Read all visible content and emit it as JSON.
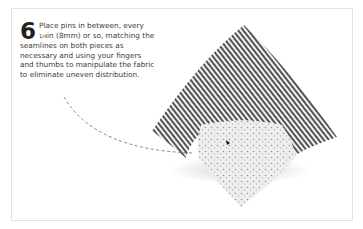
{
  "step": {
    "number": "6",
    "text_before_fraction": "Place pins in between, every ",
    "fraction": "1/4",
    "text_after_fraction": "in (8mm) or so, matching the seamlines on both pieces as necessary and using your fingers and thumbs to manipulate the fabric to eliminate uneven distribution."
  },
  "illustration": {
    "subject": "striped fabric square overlapped by a floral print fabric square, pinned together",
    "leader_line": "dashed",
    "colors": {
      "stripe_dark": "#555555",
      "stripe_light": "#f2f2f2",
      "print_base": "#eeeeee",
      "print_dots": "#9a9a9a"
    }
  }
}
